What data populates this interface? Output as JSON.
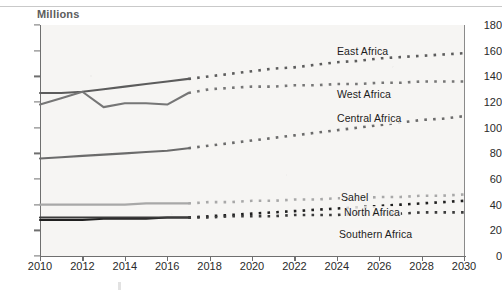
{
  "figure": {
    "unit_label": "Millions",
    "cropped_title_ghost": "",
    "background_color": "#f6f5f3",
    "axis_color": "#6f6f6f"
  },
  "chart_data": {
    "type": "line",
    "title": "",
    "subtitle": "",
    "xlabel": "",
    "ylabel": "Millions",
    "xlim": [
      2010,
      2030
    ],
    "ylim": [
      0,
      180
    ],
    "ytick_labels": [
      "0",
      "20",
      "40",
      "60",
      "80",
      "100",
      "120",
      "140",
      "160",
      "180"
    ],
    "ytick_values": [
      0,
      20,
      40,
      60,
      80,
      100,
      120,
      140,
      160,
      180
    ],
    "xtick_labels": [
      "2010",
      "2012",
      "2014",
      "2016",
      "2018",
      "2020",
      "2022",
      "2024",
      "2026",
      "2028",
      "2030"
    ],
    "xtick_values": [
      2010,
      2012,
      2014,
      2016,
      2018,
      2020,
      2022,
      2024,
      2026,
      2028,
      2030
    ],
    "grid": false,
    "legend_position": "inline-annotations",
    "historical_years": [
      2010,
      2011,
      2012,
      2013,
      2014,
      2015,
      2016,
      2017
    ],
    "projected_years": [
      2018,
      2019,
      2020,
      2021,
      2022,
      2023,
      2024,
      2025,
      2026,
      2027,
      2028,
      2029,
      2030
    ],
    "note": "Solid segment = historical 2010-2017; dotted segment = projection 2018-2030",
    "series": [
      {
        "name": "East Africa",
        "color": "#5c5c5c",
        "label_x": 336,
        "label_y": 45,
        "values": [
          127,
          127,
          128,
          130,
          132,
          134,
          136,
          138,
          140,
          142,
          144,
          146,
          147,
          149,
          151,
          152,
          154,
          155,
          156,
          157,
          158
        ]
      },
      {
        "name": "West Africa",
        "color": "#767676",
        "label_x": 336,
        "label_y": 88,
        "values": [
          118,
          123,
          128,
          116,
          119,
          119,
          118,
          127,
          130,
          131,
          132,
          132,
          133,
          133,
          134,
          134,
          135,
          135,
          136,
          136,
          136
        ]
      },
      {
        "name": "Central Africa",
        "color": "#6b6b6b",
        "label_x": 336,
        "label_y": 112,
        "values": [
          76,
          77,
          78,
          79,
          80,
          81,
          82,
          84,
          86,
          88,
          90,
          92,
          94,
          96,
          98,
          100,
          102,
          104,
          106,
          107,
          109
        ]
      },
      {
        "name": "Sahel",
        "color": "#a8a8a8",
        "label_x": 340,
        "label_y": 191,
        "values": [
          40,
          40,
          40,
          40,
          40,
          41,
          41,
          41,
          42,
          42,
          43,
          43,
          44,
          44,
          45,
          45,
          46,
          46,
          47,
          47,
          48
        ]
      },
      {
        "name": "North Africa",
        "color": "#1f1f1f",
        "label_x": 343,
        "label_y": 206,
        "values": [
          28,
          28,
          28,
          29,
          29,
          29,
          30,
          30,
          31,
          32,
          33,
          34,
          35,
          36,
          37,
          38,
          39,
          40,
          41,
          42,
          43
        ]
      },
      {
        "name": "Southern Africa",
        "color": "#3b3b3b",
        "label_x": 338,
        "label_y": 228,
        "values": [
          30,
          30,
          30,
          30,
          30,
          30,
          30,
          30,
          30,
          31,
          31,
          31,
          32,
          32,
          32,
          33,
          33,
          33,
          34,
          34,
          34
        ]
      }
    ]
  }
}
